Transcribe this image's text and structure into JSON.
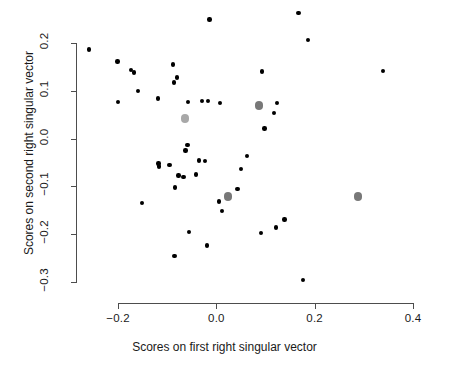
{
  "chart_data": {
    "type": "scatter",
    "title": "",
    "xlabel": "Scores on first right singular vector",
    "ylabel": "Scores on second right singular vector",
    "xlim": [
      -0.275,
      0.43
    ],
    "ylim": [
      -0.315,
      0.26
    ],
    "xticks": [
      -0.2,
      0.0,
      0.2,
      0.4
    ],
    "xticklabels": [
      "-0.2",
      "0.0",
      "0.2",
      "0.4"
    ],
    "yticks": [
      0.2,
      0.1,
      0.0,
      -0.1,
      -0.2,
      -0.3
    ],
    "yticklabels": [
      "0.2",
      "0.1",
      "0.0",
      "-0.1",
      "-0.2",
      "-0.3"
    ],
    "grid": false,
    "legend": null,
    "series": [
      {
        "name": "points",
        "color": "#000000",
        "marker": "filled-circle",
        "marker_size": 4.4,
        "points": [
          [
            -0.259,
            0.186
          ],
          [
            -0.014,
            0.249
          ],
          [
            0.167,
            0.263
          ],
          [
            0.186,
            0.206
          ],
          [
            -0.201,
            0.161
          ],
          [
            -0.173,
            0.144
          ],
          [
            -0.167,
            0.138
          ],
          [
            -0.088,
            0.155
          ],
          [
            -0.08,
            0.128
          ],
          [
            -0.086,
            0.117
          ],
          [
            -0.159,
            0.1
          ],
          [
            -0.119,
            0.084
          ],
          [
            0.093,
            0.14
          ],
          [
            0.339,
            0.142
          ],
          [
            -0.2,
            0.076
          ],
          [
            -0.057,
            0.077
          ],
          [
            -0.029,
            0.079
          ],
          [
            -0.017,
            0.079
          ],
          [
            0.007,
            0.075
          ],
          [
            0.124,
            0.074
          ],
          [
            0.117,
            0.054
          ],
          [
            0.098,
            0.021
          ],
          [
            -0.059,
            -0.013
          ],
          [
            -0.063,
            -0.025
          ],
          [
            -0.118,
            -0.052
          ],
          [
            -0.116,
            -0.058
          ],
          [
            -0.095,
            -0.055
          ],
          [
            -0.035,
            -0.046
          ],
          [
            -0.023,
            -0.047
          ],
          [
            0.063,
            -0.036
          ],
          [
            -0.077,
            -0.077
          ],
          [
            -0.067,
            -0.08
          ],
          [
            -0.041,
            -0.075
          ],
          [
            0.05,
            -0.063
          ],
          [
            -0.084,
            -0.102
          ],
          [
            0.043,
            -0.105
          ],
          [
            0.005,
            -0.132
          ],
          [
            0.011,
            -0.152
          ],
          [
            -0.151,
            -0.135
          ],
          [
            0.139,
            -0.169
          ],
          [
            0.121,
            -0.186
          ],
          [
            -0.056,
            -0.196
          ],
          [
            0.091,
            -0.198
          ],
          [
            -0.019,
            -0.224
          ],
          [
            -0.085,
            -0.245
          ],
          [
            0.176,
            -0.296
          ]
        ]
      },
      {
        "name": "highlighted-light",
        "color": "#a8a8a8",
        "marker": "filled-circle",
        "marker_size": 8.5,
        "points": [
          [
            -0.064,
            0.042
          ]
        ]
      },
      {
        "name": "highlighted-dark",
        "color": "#787878",
        "marker": "filled-circle",
        "marker_size": 8.5,
        "points": [
          [
            0.087,
            0.069
          ],
          [
            0.024,
            -0.121
          ],
          [
            0.288,
            -0.121
          ]
        ]
      }
    ]
  }
}
